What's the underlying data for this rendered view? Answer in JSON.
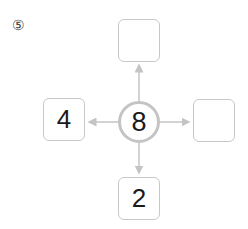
{
  "problem": {
    "number_label": "⑤"
  },
  "diagram": {
    "center": {
      "value": "8"
    },
    "top": {
      "value": ""
    },
    "left": {
      "value": "4"
    },
    "right": {
      "value": ""
    },
    "bottom": {
      "value": "2"
    }
  },
  "colors": {
    "line": "#c4c4c4",
    "box_border": "#c8c8c8",
    "text": "#1a1a1a"
  }
}
